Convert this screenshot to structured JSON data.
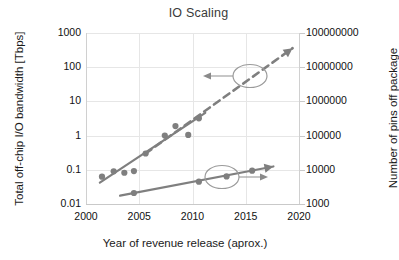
{
  "chart_data": {
    "type": "scatter",
    "title": "IO Scaling",
    "xlabel": "Year of revenue release (aprox.)",
    "ylabel": "Total off-chip I/O bandwidth [Tbps]",
    "ylabel_right": "Number of pins off package",
    "xlim": [
      2000,
      2020
    ],
    "xticks": [
      "2000",
      "2005",
      "2010",
      "2015",
      "2020"
    ],
    "xtick_values": [
      2000,
      2005,
      2010,
      2015,
      2020
    ],
    "ylim": [
      0.01,
      1000
    ],
    "yscale": "log",
    "yticks": [
      "1000",
      "100",
      "10",
      "1",
      "0.1",
      "0.01"
    ],
    "ytick_values": [
      1000,
      100,
      10,
      1,
      0.1,
      0.01
    ],
    "ylim_right": [
      1000,
      100000000
    ],
    "yscale_right": "log",
    "yticks_right": [
      "100000000",
      "10000000",
      "1000000",
      "100000",
      "10000",
      "1000"
    ],
    "ytick_values_right": [
      100000000,
      10000000,
      1000000,
      100000,
      10000,
      1000
    ],
    "grid": true,
    "legend": "none",
    "series": [
      {
        "name": "Total off-chip I/O bandwidth",
        "axis": "left",
        "style": "scatter-with-trendline",
        "color": "#7f7f7f",
        "points": [
          {
            "x": 2001.5,
            "y": 0.063
          },
          {
            "x": 2002.6,
            "y": 0.09
          },
          {
            "x": 2003.6,
            "y": 0.082
          },
          {
            "x": 2004.5,
            "y": 0.092
          },
          {
            "x": 2005.6,
            "y": 0.3
          },
          {
            "x": 2007.4,
            "y": 1.0
          },
          {
            "x": 2008.4,
            "y": 1.9
          },
          {
            "x": 2009.6,
            "y": 1.05
          },
          {
            "x": 2010.6,
            "y": 3.2
          }
        ],
        "trendline": {
          "x0": 2001.3,
          "y0": 0.042,
          "x1": 2011.2,
          "y1": 4.6
        }
      },
      {
        "name": "Number of pins off package",
        "axis": "right",
        "style": "scatter-with-trendline-arrow",
        "color": "#7f7f7f",
        "points": [
          {
            "x": 2004.5,
            "y": 2100
          },
          {
            "x": 2010.6,
            "y": 4500
          },
          {
            "x": 2013.2,
            "y": 6400
          },
          {
            "x": 2015.6,
            "y": 9400
          }
        ],
        "trendline": {
          "x0": 2003.2,
          "y0": 1750,
          "x1": 2017.6,
          "y1": 12500
        }
      },
      {
        "name": "Projected bandwidth trend",
        "axis": "left",
        "style": "dashed-arrow",
        "color": "#7f7f7f",
        "trendline": {
          "x0": 2005.6,
          "y0": 0.3,
          "x1": 2019.4,
          "y1": 360
        }
      }
    ],
    "annotations": [
      {
        "name": "left-axis-callout",
        "shape": "ellipse-with-left-arrow",
        "target": "dashed bandwidth curve",
        "points_to": "left axis"
      },
      {
        "name": "right-axis-callout",
        "shape": "ellipse-with-right-arrow",
        "target": "solid pins curve",
        "points_to": "right axis"
      }
    ]
  }
}
